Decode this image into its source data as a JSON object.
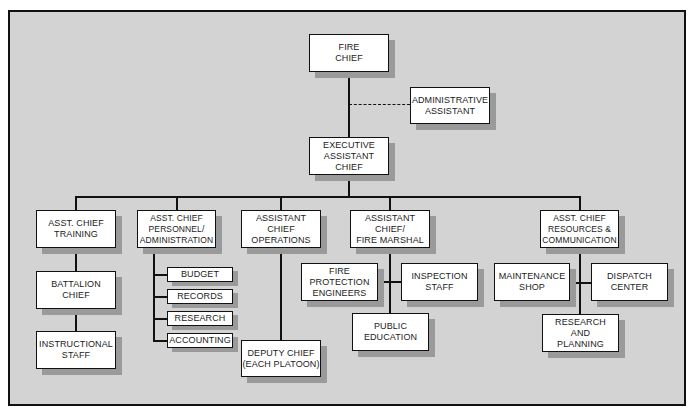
{
  "chart_title": "",
  "nodes": {
    "fire_chief": "FIRE\nCHIEF",
    "admin_assistant": "ADMINISTRATIVE\nASSISTANT",
    "exec_asst_chief": "EXECUTIVE\nASSISTANT\nCHIEF",
    "training": "ASST. CHIEF\nTRAINING",
    "battalion_chief": "BATTALION\nCHIEF",
    "instructional_staff": "INSTRUCTIONAL\nSTAFF",
    "personnel": "ASST. CHIEF\nPERSONNEL/\nADMINISTRATION",
    "budget": "BUDGET",
    "records": "RECORDS",
    "research": "RESEARCH",
    "accounting": "ACCOUNTING",
    "operations": "ASSISTANT\nCHIEF\nOPERATIONS",
    "deputy_chief": "DEPUTY CHIEF\n(EACH PLATOON)",
    "fire_marshal": "ASSISTANT\nCHIEF/\nFIRE MARSHAL",
    "fire_protection_engineers": "FIRE\nPROTECTION\nENGINEERS",
    "inspection_staff": "INSPECTION\nSTAFF",
    "public_education": "PUBLIC\nEDUCATION",
    "resources": "ASST. CHIEF\nRESOURCES &\nCOMMUNICATION",
    "maintenance_shop": "MAINTENANCE\nSHOP",
    "dispatch_center": "DISPATCH\nCENTER",
    "research_planning": "RESEARCH\nAND\nPLANNING"
  },
  "colors": {
    "background": "#d3d3d3",
    "box_fill": "#ffffff",
    "line": "#111111",
    "shadow": "#9a9a9a"
  }
}
